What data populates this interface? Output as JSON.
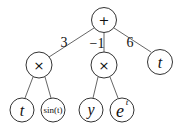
{
  "diagram": {
    "type": "expression-tree",
    "nodes": [
      {
        "id": "root",
        "label": "+",
        "x": 104,
        "y": 20
      },
      {
        "id": "mul1",
        "label": "×",
        "x": 39,
        "y": 65
      },
      {
        "id": "mul2",
        "label": "×",
        "x": 104,
        "y": 65
      },
      {
        "id": "t_top",
        "label": "t",
        "x": 160,
        "y": 62
      },
      {
        "id": "t_leaf",
        "label": "t",
        "x": 22,
        "y": 110
      },
      {
        "id": "sin",
        "label": "sin(t)",
        "x": 53,
        "y": 110
      },
      {
        "id": "y",
        "label": "y",
        "x": 91,
        "y": 110
      },
      {
        "id": "exp",
        "label": "e",
        "sup": "t",
        "x": 122,
        "y": 110
      }
    ],
    "edges": [
      {
        "from": "root",
        "to": "mul1",
        "weight": "3"
      },
      {
        "from": "root",
        "to": "mul2",
        "weight": "−1"
      },
      {
        "from": "root",
        "to": "t_top",
        "weight": "6"
      },
      {
        "from": "mul1",
        "to": "t_leaf"
      },
      {
        "from": "mul1",
        "to": "sin"
      },
      {
        "from": "mul2",
        "to": "y"
      },
      {
        "from": "mul2",
        "to": "exp"
      }
    ],
    "weights": {
      "w1": "3",
      "w2": "−1",
      "w3": "6"
    }
  }
}
